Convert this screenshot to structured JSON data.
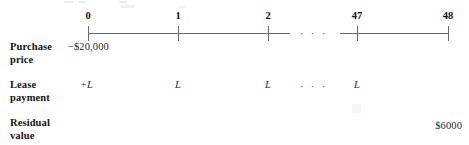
{
  "figure": {
    "type": "cash-flow-timeline",
    "title": ""
  },
  "timeline": {
    "ticks": [
      {
        "label": "0",
        "x": 88
      },
      {
        "label": "1",
        "x": 178
      },
      {
        "label": "2",
        "x": 268
      },
      {
        "label": "47",
        "x": 357
      },
      {
        "label": "48",
        "x": 448
      }
    ],
    "segments": [
      {
        "x": 88,
        "width": 202
      },
      {
        "x": 340,
        "width": 108
      }
    ],
    "break_marker": "· · ·",
    "break_x": 300
  },
  "rows": [
    {
      "name": "purchase-price",
      "label_line1": "Purchase",
      "label_line2": "price",
      "y": 41,
      "values": [
        {
          "at": "0",
          "text": "−$20,000",
          "x": 68,
          "align": "left"
        }
      ]
    },
    {
      "name": "lease-payment",
      "label_line1": "Lease",
      "label_line2": "payment",
      "y": 79,
      "values": [
        {
          "at": "0",
          "text": "+L",
          "x": 80,
          "align": "left"
        },
        {
          "at": "1",
          "text": "L",
          "x": 178,
          "align": "center"
        },
        {
          "at": "2",
          "text": "L",
          "x": 268,
          "align": "center"
        },
        {
          "at": "47",
          "text": "L",
          "x": 357,
          "align": "center"
        }
      ],
      "break_marker": "· · ·",
      "break_x": 300
    },
    {
      "name": "residual-value",
      "label_line1": "Residual",
      "label_line2": "value",
      "y": 117,
      "values": [
        {
          "at": "48",
          "text": "$6000",
          "x": 462,
          "align": "right"
        }
      ]
    }
  ]
}
